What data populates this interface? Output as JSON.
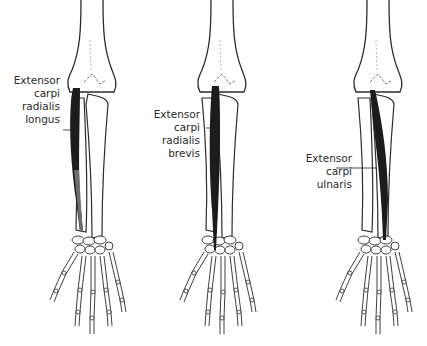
{
  "diagram": {
    "panels": [
      {
        "id": "left",
        "muscle": "Extensor carpi radialis longus",
        "label_lines": [
          "Extensor",
          "carpi",
          "radialis",
          "longus"
        ]
      },
      {
        "id": "middle",
        "muscle": "Extensor carpi radialis brevis",
        "label_lines": [
          "Extensor",
          "carpi",
          "radialis",
          "brevis"
        ]
      },
      {
        "id": "right",
        "muscle": "Extensor carpi ulnaris",
        "label_lines": [
          "Extensor",
          "carpi",
          "ulnaris"
        ]
      }
    ],
    "colors": {
      "bone_outline": "#2b2b2b",
      "muscle_dark": "#1c1c1c",
      "muscle_gray": "#6e6e6e",
      "background": "#ffffff"
    }
  }
}
